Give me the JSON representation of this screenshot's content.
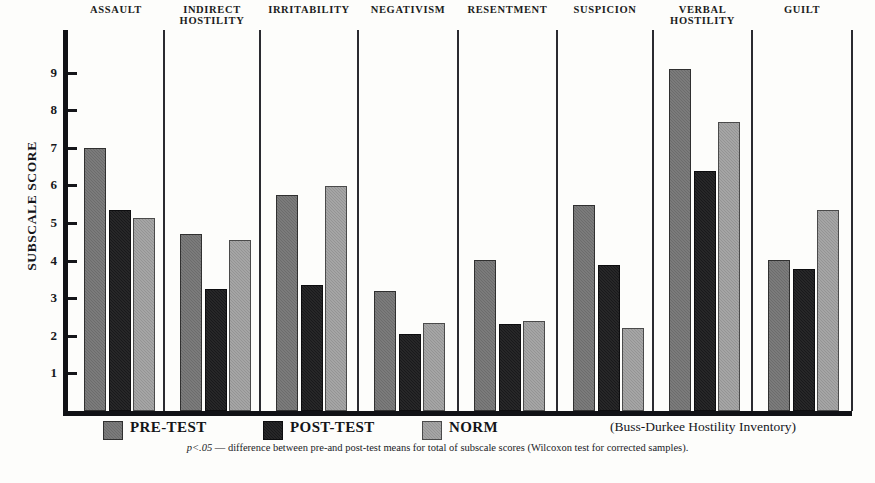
{
  "chart_data": {
    "type": "bar",
    "title": "",
    "xlabel": "",
    "ylabel": "SUBSCALE SCORE",
    "ylim": [
      0,
      9.6
    ],
    "yticks": [
      1,
      2,
      3,
      4,
      5,
      6,
      7,
      8,
      9
    ],
    "grid": false,
    "legend_position": "bottom",
    "categories": [
      "ASSAULT",
      "INDIRECT\nHOSTILITY",
      "IRRITABILITY",
      "NEGATIVISM",
      "RESENTMENT",
      "SUSPICION",
      "VERBAL\nHOSTILITY",
      "GUILT"
    ],
    "series": [
      {
        "name": "PRE-TEST",
        "color": "#6c6c6c",
        "values": [
          6.95,
          4.65,
          5.7,
          3.15,
          3.95,
          5.42,
          9.04,
          3.95
        ]
      },
      {
        "name": "POST-TEST",
        "color": "#19191b",
        "values": [
          5.28,
          3.2,
          3.3,
          2.0,
          2.25,
          3.82,
          6.33,
          3.72
        ]
      },
      {
        "name": "NORM",
        "color": "#949494",
        "values": [
          5.08,
          4.5,
          5.92,
          2.28,
          2.33,
          2.15,
          7.63,
          5.28
        ]
      }
    ],
    "annotation": "(Buss-Durkee Hostility Inventory)",
    "footnote": "p<.05 — difference between pre-and post-test means for total of subscale scores  (Wilcoxon test for corrected samples).",
    "footnote_pval": "p<.05",
    "footnote_rest": " — difference between pre-and post-test means for total of subscale scores  (Wilcoxon test for corrected samples)."
  },
  "axis": {
    "y_title": "SUBSCALE SCORE",
    "tick_labels": [
      "9",
      "8",
      "7",
      "6",
      "5",
      "4",
      "3",
      "2",
      "1"
    ]
  },
  "groups": [
    {
      "label": "ASSAULT"
    },
    {
      "label": "INDIRECT\nHOSTILITY"
    },
    {
      "label": "IRRITABILITY"
    },
    {
      "label": "NEGATIVISM"
    },
    {
      "label": "RESENTMENT"
    },
    {
      "label": "SUSPICION"
    },
    {
      "label": "VERBAL\nHOSTILITY"
    },
    {
      "label": "GUILT"
    }
  ],
  "legend": {
    "items": [
      {
        "label": "PRE-TEST",
        "color": "#6c6c6c"
      },
      {
        "label": "POST-TEST",
        "color": "#19191b"
      },
      {
        "label": "NORM",
        "color": "#949494"
      }
    ],
    "inventory_note": "(Buss-Durkee Hostility Inventory)"
  }
}
